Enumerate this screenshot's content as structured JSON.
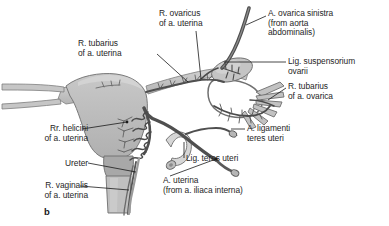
{
  "figure": {
    "panel_letter": "b",
    "caption_subject": "Arterial supply of the uterus, uterine tube and ovary",
    "colors": {
      "organ_fill": "#bcbcbc",
      "organ_fill_light": "#cfcfcf",
      "organ_fill_dark": "#a6a6a6",
      "vessel_dark": "#5a5a5a",
      "vessel_mid": "#777777",
      "outline": "#555555",
      "leader_line": "#1a1a1a",
      "text": "#262626",
      "background": "#ffffff"
    }
  },
  "labels": [
    {
      "id": "r-ovaricus",
      "name": "label-r-ovaricus-of-a-uterina",
      "lines": [
        "R. ovaricus",
        "of a. uterina"
      ],
      "text": "R. ovaricus\nof a. uterina",
      "x": 159,
      "y": 9,
      "align": "left"
    },
    {
      "id": "a-ovarica-sinistra",
      "name": "label-a-ovarica-sinistra",
      "lines": [
        "A. ovarica sinistra",
        "(from aorta",
        "abdominalis)"
      ],
      "text": "A. ovarica sinistra\n(from aorta\nabdominalis)",
      "x": 268,
      "y": 9,
      "align": "left"
    },
    {
      "id": "r-tubarius-uterina",
      "name": "label-r-tubarius-of-a-uterina",
      "lines": [
        "R. tubarius",
        "of a. uterina"
      ],
      "text": "R. tubarius\nof a. uterina",
      "x": 78,
      "y": 39,
      "align": "left"
    },
    {
      "id": "lig-suspensorium-ovarii",
      "name": "label-lig-suspensorium-ovarii",
      "lines": [
        "Lig. suspensorium",
        "ovarii"
      ],
      "text": "Lig. suspensorium\novarii",
      "x": 288,
      "y": 57,
      "align": "left"
    },
    {
      "id": "r-tubarius-ovarica",
      "name": "label-r-tubarius-of-a-ovarica",
      "lines": [
        "R. tubarius",
        "of a. ovarica"
      ],
      "text": "R. tubarius\nof a. ovarica",
      "x": 288,
      "y": 82,
      "align": "left"
    },
    {
      "id": "rr-helicini",
      "name": "label-rr-helicini-of-a-uterina",
      "lines": [
        "Rr. helicini",
        "of a. uterina"
      ],
      "text": "Rr. helicini\nof a. uterina",
      "x": 24,
      "y": 124,
      "align": "left"
    },
    {
      "id": "a-ligamenti-teres",
      "name": "label-a-ligamenti-teres-uteri",
      "lines": [
        "A. ligamenti",
        "teres uteri"
      ],
      "text": "A. ligamenti\nteres uteri",
      "x": 247,
      "y": 124,
      "align": "left"
    },
    {
      "id": "lig-teres-uteri",
      "name": "label-lig-teres-uteri",
      "lines": [
        "Lig. teres uteri"
      ],
      "text": "Lig. teres uteri",
      "x": 186,
      "y": 156,
      "align": "left"
    },
    {
      "id": "ureter",
      "name": "label-ureter",
      "lines": [
        "Ureter"
      ],
      "text": "Ureter",
      "x": 55,
      "y": 159,
      "align": "left"
    },
    {
      "id": "r-vaginalis",
      "name": "label-r-vaginalis-of-a-uterina",
      "lines": [
        "R. vaginalis",
        "of a. uterina"
      ],
      "text": "R. vaginalis\nof a. uterina",
      "x": 22,
      "y": 181,
      "align": "left"
    },
    {
      "id": "a-uterina",
      "name": "label-a-uterina",
      "lines": [
        "A. uterina",
        "(from a. iliaca interna)"
      ],
      "text": "A. uterina\n(from a. iliaca interna)",
      "x": 163,
      "y": 176,
      "align": "left"
    }
  ]
}
